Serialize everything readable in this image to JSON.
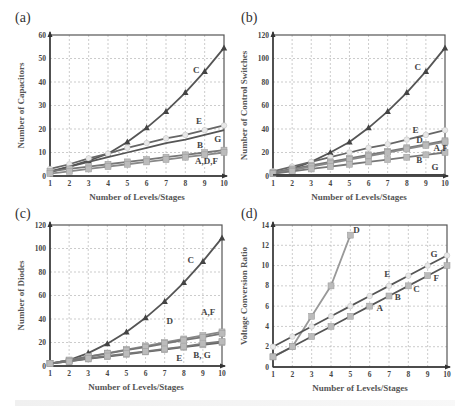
{
  "panels": [
    {
      "id": "a",
      "label": "(a)"
    },
    {
      "id": "b",
      "label": "(b)"
    },
    {
      "id": "c",
      "label": "(c)"
    },
    {
      "id": "d",
      "label": "(d)"
    }
  ],
  "chart_data": [
    {
      "panel": "(a)",
      "type": "line",
      "title": "",
      "xlabel": "Number of Levels/Stages",
      "ylabel": "Number of Capacitors",
      "x": [
        1,
        2,
        3,
        4,
        5,
        6,
        7,
        8,
        9,
        10
      ],
      "xlim": [
        1,
        10
      ],
      "ylim": [
        0,
        60
      ],
      "yticks": [
        0,
        10,
        20,
        30,
        40,
        50,
        60
      ],
      "grid": true,
      "series": [
        {
          "name": "C",
          "values": [
            1.5,
            4,
            6.5,
            9.5,
            14.5,
            20.5,
            27.5,
            35.5,
            44.5,
            54.5
          ],
          "marker": "triangle",
          "color": "#555555"
        },
        {
          "name": "E",
          "values": [
            3,
            5,
            7.5,
            9.5,
            12,
            14,
            16,
            17.5,
            19.5,
            21.5
          ],
          "marker": "circle",
          "color": "#666666"
        },
        {
          "name": "G",
          "values": [
            2,
            4,
            6,
            8,
            10,
            12,
            14,
            15.5,
            17.5,
            19.5
          ],
          "marker": "none",
          "color": "#555555"
        },
        {
          "name": "B",
          "values": [
            2,
            3,
            4,
            5,
            6,
            7,
            8,
            9,
            10,
            11
          ],
          "marker": "square",
          "color": "#777777"
        },
        {
          "name": "A,D,F",
          "values": [
            1,
            2,
            3,
            4,
            5,
            6,
            7,
            8,
            9,
            10
          ],
          "marker": "square",
          "color": "#888888"
        }
      ],
      "labels": [
        {
          "text": "C",
          "x": 8.4,
          "y": 44
        },
        {
          "text": "E",
          "x": 8.55,
          "y": 22
        },
        {
          "text": "G",
          "x": 9.5,
          "y": 14.5
        },
        {
          "text": "B",
          "x": 8.6,
          "y": 12
        },
        {
          "text": "A,D,F",
          "x": 8.5,
          "y": 5
        }
      ]
    },
    {
      "panel": "(b)",
      "type": "line",
      "title": "",
      "xlabel": "Number of Levels/Stages",
      "ylabel": "Number of Control Switches",
      "x": [
        1,
        2,
        3,
        4,
        5,
        6,
        7,
        8,
        9,
        10
      ],
      "xlim": [
        1,
        10
      ],
      "ylim": [
        0,
        120
      ],
      "yticks": [
        0,
        20,
        40,
        60,
        80,
        100,
        120
      ],
      "grid": true,
      "series": [
        {
          "name": "C",
          "values": [
            2,
            6,
            12,
            20,
            29,
            41,
            55,
            71,
            89,
            109
          ],
          "marker": "triangle",
          "color": "#555555"
        },
        {
          "name": "E",
          "values": [
            4,
            8,
            12,
            16,
            20,
            24,
            27,
            31,
            35,
            39
          ],
          "marker": "circle",
          "color": "#666666"
        },
        {
          "name": "D",
          "values": [
            3,
            6,
            9,
            12,
            15,
            18,
            21,
            24,
            27,
            30
          ],
          "marker": "square",
          "color": "#777777"
        },
        {
          "name": "A,F",
          "values": [
            2,
            5,
            8,
            11,
            14,
            17,
            20,
            23,
            26,
            29
          ],
          "marker": "square",
          "color": "#888888"
        },
        {
          "name": "B",
          "values": [
            2,
            4,
            6,
            8,
            10,
            12,
            14,
            16,
            18,
            20
          ],
          "marker": "square",
          "color": "#777777"
        },
        {
          "name": "G",
          "values": [
            1,
            1,
            1,
            1,
            1,
            1,
            1,
            1,
            1,
            1
          ],
          "marker": "none",
          "color": "#444444"
        }
      ],
      "labels": [
        {
          "text": "C",
          "x": 8.4,
          "y": 90
        },
        {
          "text": "E",
          "x": 8.3,
          "y": 37
        },
        {
          "text": "D",
          "x": 8.5,
          "y": 28
        },
        {
          "text": "A,F",
          "x": 9.4,
          "y": 21
        },
        {
          "text": "B",
          "x": 8.5,
          "y": 11
        },
        {
          "text": "G",
          "x": 9.3,
          "y": 5
        }
      ]
    },
    {
      "panel": "(c)",
      "type": "line",
      "title": "",
      "xlabel": "Number of Levels/Stages",
      "ylabel": "Number of Diodes",
      "x": [
        1,
        2,
        3,
        4,
        5,
        6,
        7,
        8,
        9,
        10
      ],
      "xlim": [
        1,
        10
      ],
      "ylim": [
        0,
        120
      ],
      "yticks": [
        0,
        20,
        40,
        60,
        80,
        100,
        120
      ],
      "grid": true,
      "series": [
        {
          "name": "C",
          "values": [
            2,
            5,
            11,
            19,
            29,
            41,
            55,
            71,
            89,
            109
          ],
          "marker": "triangle",
          "color": "#555555"
        },
        {
          "name": "A,F",
          "values": [
            2,
            5,
            8,
            11,
            14,
            17,
            20,
            23,
            26,
            29
          ],
          "marker": "square",
          "color": "#888888"
        },
        {
          "name": "D",
          "values": [
            2,
            5,
            8,
            10.5,
            13.5,
            16,
            19,
            22,
            24.5,
            27.5
          ],
          "marker": "square",
          "color": "#777777"
        },
        {
          "name": "E",
          "values": [
            2,
            4,
            6,
            8,
            10,
            12,
            14,
            16,
            18,
            20
          ],
          "marker": "square",
          "color": "#666666"
        },
        {
          "name": "B, G",
          "values": [
            2,
            4,
            6.5,
            8.5,
            10.5,
            12.5,
            14.5,
            16.5,
            19,
            21
          ],
          "marker": "square",
          "color": "#777777"
        }
      ],
      "labels": [
        {
          "text": "C",
          "x": 8.2,
          "y": 88
        },
        {
          "text": "A,F",
          "x": 8.9,
          "y": 43
        },
        {
          "text": "D",
          "x": 7.1,
          "y": 36
        },
        {
          "text": "E",
          "x": 7.6,
          "y": 4
        },
        {
          "text": "B, G",
          "x": 8.5,
          "y": 7
        }
      ]
    },
    {
      "panel": "(d)",
      "type": "line",
      "title": "",
      "xlabel": "Number of Levels/Stages",
      "ylabel": "Voltage Conversion Ratio",
      "x": [
        1,
        2,
        3,
        4,
        5,
        6,
        7,
        8,
        9,
        10
      ],
      "xlim": [
        1,
        10
      ],
      "ylim": [
        0,
        14
      ],
      "yticks": [
        0,
        2,
        4,
        6,
        8,
        10,
        12,
        14
      ],
      "grid": true,
      "series": [
        {
          "name": "D",
          "x": [
            1,
            2,
            3,
            4,
            5
          ],
          "values": [
            1,
            2,
            5,
            8,
            13
          ],
          "marker": "square",
          "color": "#999999"
        },
        {
          "name": "E,G",
          "values": [
            2,
            3,
            4,
            5,
            6,
            7,
            8,
            9,
            10,
            11
          ],
          "marker": "circle",
          "color": "#555555"
        },
        {
          "name": "A,B,C,F",
          "values": [
            1,
            2,
            3,
            4,
            5,
            6,
            7,
            8,
            9,
            10
          ],
          "marker": "square",
          "color": "#555555"
        }
      ],
      "labels": [
        {
          "text": "D",
          "x": 5.15,
          "y": 13.2
        },
        {
          "text": "G",
          "x": 9.15,
          "y": 10.8
        },
        {
          "text": "E",
          "x": 6.75,
          "y": 8.9
        },
        {
          "text": "F",
          "x": 9.3,
          "y": 8.5
        },
        {
          "text": "C",
          "x": 8.25,
          "y": 7.4
        },
        {
          "text": "B",
          "x": 7.3,
          "y": 6.6
        },
        {
          "text": "A",
          "x": 6.35,
          "y": 5.5
        }
      ]
    }
  ]
}
